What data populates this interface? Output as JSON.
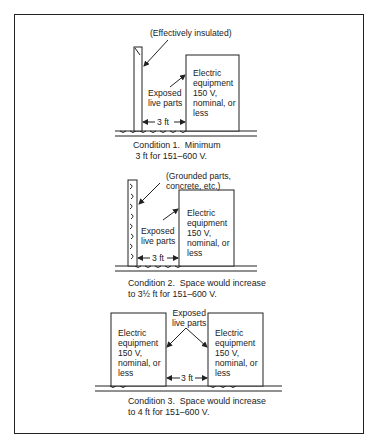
{
  "conditions": [
    {
      "insulation_label": "(Effectively insulated)",
      "exposed_label": "Exposed\nlive parts",
      "equipment_label": "Electric\nequipment\n150 V,\nnominal, or\nless",
      "distance_label": "3 ft",
      "caption": "Condition 1.  Minimum\n 3 ft for 151–600 V."
    },
    {
      "insulation_label": "(Grounded parts,\nconcrete, etc.)",
      "exposed_label": "Exposed\nlive parts",
      "equipment_label": "Electric\nequipment\n150 V,\nnominal, or\nless",
      "distance_label": "3 ft",
      "caption": "Condition 2.  Space would increase\nto 3½ ft for 151–600 V."
    },
    {
      "exposed_label": "Exposed\nlive parts",
      "equipment_left_label": "Electric\nequipment\n150 V,\nnominal, or\nless",
      "equipment_right_label": "Electric\nequipment\n150 V,\nnominal, or\nless",
      "distance_label": "3 ft",
      "caption": "Condition 3.  Space would increase\nto 4 ft for 151–600 V."
    }
  ]
}
